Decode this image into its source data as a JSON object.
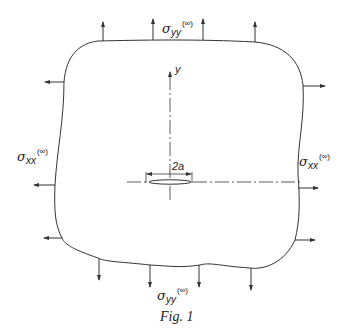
{
  "figure": {
    "caption": "Fig. 1",
    "labels": {
      "top_stress": {
        "symbol": "σ",
        "subscript": "yy",
        "superscript": "(∞)"
      },
      "bottom_stress": {
        "symbol": "σ",
        "subscript": "yy",
        "superscript": "(∞)"
      },
      "left_stress": {
        "symbol": "σ",
        "subscript": "xx",
        "superscript": "(∞)"
      },
      "right_stress": {
        "symbol": "σ",
        "subscript": "xx",
        "superscript": "(∞)"
      },
      "y_axis": "y",
      "crack_length": "2a"
    },
    "arrows": {
      "top_count": 4,
      "bottom_count": 4,
      "left_count": 3,
      "right_count": 3
    },
    "colors": {
      "line": "#333333",
      "background": "#ffffff"
    }
  }
}
